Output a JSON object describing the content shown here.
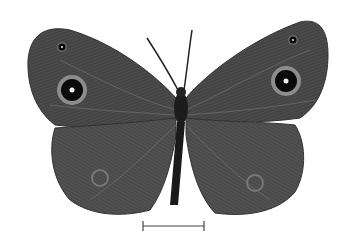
{
  "image": {
    "subject": "butterfly specimen (dorsal view)",
    "background": "#ffffff",
    "colors": {
      "wing_dark": "#3a3a3a",
      "wing_mid": "#5a5a5a",
      "wing_light": "#8a8a8a",
      "body": "#1c1c1c",
      "eyespot_ring": "#9a9a9a",
      "eyespot_core": "#0a0a0a",
      "eyespot_pupil": "#f0f0f0",
      "scale_bar": "#444444"
    },
    "scale_bar": {
      "x1": 143,
      "x2": 204,
      "y": 226
    }
  }
}
